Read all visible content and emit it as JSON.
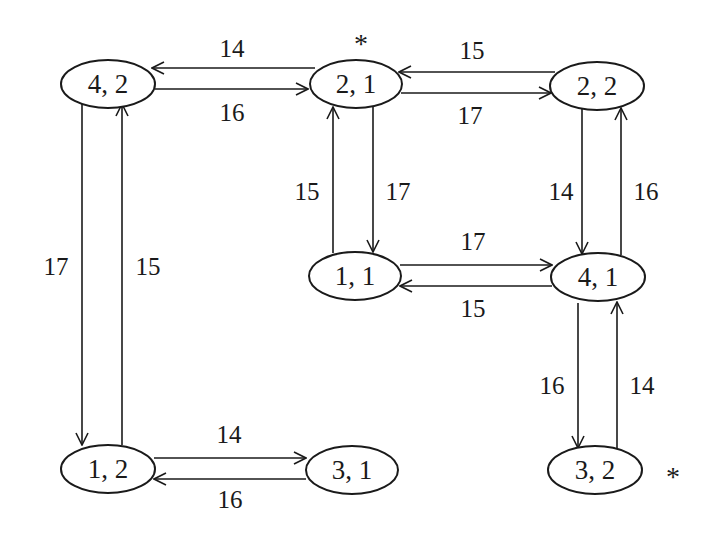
{
  "diagram": {
    "type": "state-transition-graph",
    "nodes": [
      {
        "id": "n42",
        "label": "4, 2",
        "cx": 108,
        "cy": 84
      },
      {
        "id": "n21",
        "label": "2, 1",
        "cx": 356,
        "cy": 84,
        "marked": true
      },
      {
        "id": "n22",
        "label": "2, 2",
        "cx": 597,
        "cy": 86
      },
      {
        "id": "n11",
        "label": "1, 1",
        "cx": 355,
        "cy": 276
      },
      {
        "id": "n41",
        "label": "4, 1",
        "cx": 598,
        "cy": 277
      },
      {
        "id": "n12",
        "label": "1, 2",
        "cx": 108,
        "cy": 469
      },
      {
        "id": "n31",
        "label": "3, 1",
        "cx": 352,
        "cy": 470
      },
      {
        "id": "n32",
        "label": "3, 2",
        "cx": 595,
        "cy": 470,
        "marked": true
      }
    ],
    "edges": [
      {
        "from": "2, 1",
        "to": "4, 2",
        "weight": "14"
      },
      {
        "from": "4, 2",
        "to": "2, 1",
        "weight": "16"
      },
      {
        "from": "2, 2",
        "to": "2, 1",
        "weight": "15"
      },
      {
        "from": "2, 1",
        "to": "2, 2",
        "weight": "17"
      },
      {
        "from": "1, 1",
        "to": "2, 1",
        "weight": "15"
      },
      {
        "from": "2, 1",
        "to": "1, 1",
        "weight": "17"
      },
      {
        "from": "2, 2",
        "to": "4, 1",
        "weight": "14"
      },
      {
        "from": "4, 1",
        "to": "2, 2",
        "weight": "16"
      },
      {
        "from": "1, 1",
        "to": "4, 1",
        "weight": "17"
      },
      {
        "from": "4, 1",
        "to": "1, 1",
        "weight": "15"
      },
      {
        "from": "4, 2",
        "to": "1, 2",
        "weight": "17"
      },
      {
        "from": "1, 2",
        "to": "4, 2",
        "weight": "15"
      },
      {
        "from": "1, 2",
        "to": "3, 1",
        "weight": "14"
      },
      {
        "from": "3, 1",
        "to": "1, 2",
        "weight": "16"
      },
      {
        "from": "4, 1",
        "to": "3, 2",
        "weight": "16"
      },
      {
        "from": "3, 2",
        "to": "4, 1",
        "weight": "14"
      }
    ],
    "markers": {
      "star_symbol": "*",
      "marked_nodes": [
        "2, 1",
        "3, 2"
      ]
    }
  }
}
